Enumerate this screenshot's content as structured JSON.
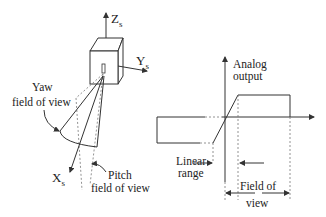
{
  "sensor": {
    "axis_z": {
      "main": "Z",
      "sub": "s"
    },
    "axis_y": {
      "main": "Y",
      "sub": "s"
    },
    "axis_x": {
      "main": "X",
      "sub": "s"
    },
    "yaw_label_line1": "Yaw",
    "yaw_label_line2": "field of view",
    "pitch_label_line1": "Pitch",
    "pitch_label_line2": "field  of view"
  },
  "graph": {
    "y_axis_label_line1": "Analog",
    "y_axis_label_line2": "output",
    "linear_range_line1": "Linear",
    "linear_range_line2": "range",
    "fov_line1": "Field  of",
    "fov_line2": "view"
  },
  "colors": {
    "line": "#333333",
    "dashed": "#777777",
    "background": "#ffffff"
  }
}
